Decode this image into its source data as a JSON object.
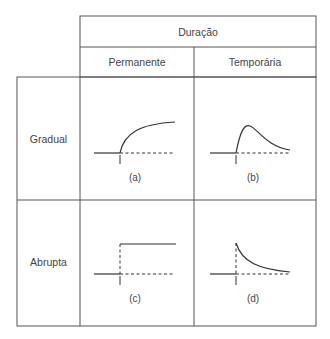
{
  "header": {
    "title": "Duração",
    "columns": [
      {
        "label": "Permanente"
      },
      {
        "label": "Temporária"
      }
    ]
  },
  "rows": [
    {
      "label": "Gradual"
    },
    {
      "label": "Abrupta"
    }
  ],
  "panels": [
    {
      "id": "a",
      "caption": "(a)",
      "shape": "gradual-permanent",
      "marker": "I"
    },
    {
      "id": "b",
      "caption": "(b)",
      "shape": "gradual-temporary",
      "marker": "I"
    },
    {
      "id": "c",
      "caption": "(c)",
      "shape": "abrupt-permanent",
      "marker": "I"
    },
    {
      "id": "d",
      "caption": "(d)",
      "shape": "abrupt-temporary",
      "marker": "I"
    }
  ],
  "colors": {
    "line": "#333333",
    "border": "#555555",
    "text": "#444444"
  }
}
